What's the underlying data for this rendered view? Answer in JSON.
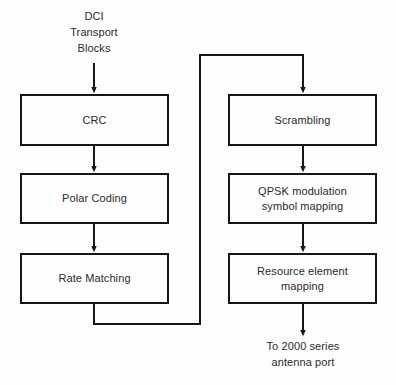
{
  "diagram": {
    "background_color": "#fdfdfd",
    "line_color": "#161616",
    "text_color": "#2b2b2b",
    "labels": {
      "input": "DCI\nTransport\nBlocks",
      "output": "To 2000 series\nantenna port"
    },
    "nodes": [
      {
        "id": "crc",
        "label": "CRC",
        "column": "left",
        "row": 1
      },
      {
        "id": "polar",
        "label": "Polar Coding",
        "column": "left",
        "row": 2
      },
      {
        "id": "rate",
        "label": "Rate Matching",
        "column": "left",
        "row": 3
      },
      {
        "id": "scrambling",
        "label": "Scrambling",
        "column": "right",
        "row": 1
      },
      {
        "id": "qpsk",
        "label": "QPSK modulation\nsymbol mapping",
        "column": "right",
        "row": 2
      },
      {
        "id": "resource",
        "label": "Resource element\nmapping",
        "column": "right",
        "row": 3
      }
    ],
    "edges": [
      {
        "from": "input",
        "to": "crc",
        "kind": "straight-arrow"
      },
      {
        "from": "crc",
        "to": "polar",
        "kind": "straight-arrow"
      },
      {
        "from": "polar",
        "to": "rate",
        "kind": "straight-arrow"
      },
      {
        "from": "rate",
        "to": "scrambling",
        "kind": "routed-arrow"
      },
      {
        "from": "scrambling",
        "to": "qpsk",
        "kind": "straight-arrow"
      },
      {
        "from": "qpsk",
        "to": "resource",
        "kind": "straight-arrow"
      },
      {
        "from": "resource",
        "to": "output",
        "kind": "straight-arrow"
      }
    ]
  }
}
